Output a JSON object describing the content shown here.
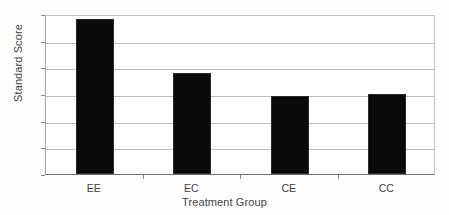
{
  "chart_data": {
    "type": "bar",
    "title": "",
    "subtitle": "",
    "categories": [
      "EE",
      "EC",
      "CE",
      "CC"
    ],
    "values": [
      97.6,
      93.6,
      91.85,
      92.0
    ],
    "xlabel": "Treatment Group",
    "ylabel": "Standard Score",
    "ylim": [
      86,
      98
    ],
    "yticks": [
      86,
      88,
      90,
      92,
      94,
      96,
      98
    ],
    "ytick_labels": [
      "86",
      "88",
      "90",
      "92",
      "94",
      "96",
      "98"
    ],
    "grid": "horizontal",
    "legend": "none",
    "bar_color": "#0a0a0a",
    "grid_color": "#bdbdbd",
    "axis_color": "#6e6e6e",
    "background_color": "#ffffff",
    "annotations": []
  }
}
